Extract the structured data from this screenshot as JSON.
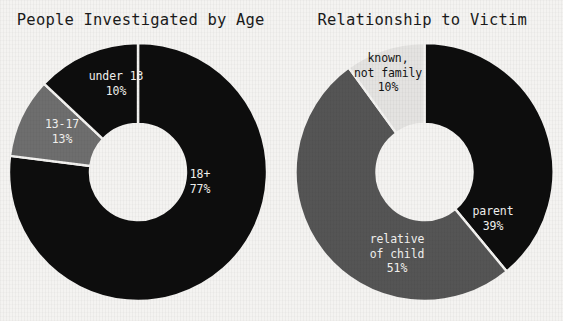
{
  "page": {
    "background_color": "#f4f3f1",
    "width": 563,
    "height": 321
  },
  "charts": [
    {
      "id": "people-investigated-by-age",
      "title": "People Investigated by Age",
      "center": {
        "x": 138,
        "y": 172
      },
      "outer_radius": 129,
      "inner_radius": 48,
      "slices": [
        {
          "label": "18+",
          "percent_label": "77%",
          "value": 77,
          "color": "#0d0d0d",
          "text_color": "#f2f1ef",
          "label_x": 200,
          "label_y": 178
        },
        {
          "label": "under 13",
          "percent_label": "10%",
          "value": 10,
          "color": "#6e6e6e",
          "text_color": "#f2f1ef",
          "label_x": 116,
          "label_y": 80
        },
        {
          "label": "13-17",
          "percent_label": "13%",
          "value": 13,
          "color": "#0d0d0d",
          "text_color": "#f2f1ef",
          "label_x": 62,
          "label_y": 128
        }
      ]
    },
    {
      "id": "relationship-to-victim",
      "title": "Relationship to Victim",
      "center": {
        "x": 142.5,
        "y": 172
      },
      "outer_radius": 129,
      "inner_radius": 48,
      "slices": [
        {
          "label": "parent",
          "percent_label": "39%",
          "value": 39,
          "color": "#0d0d0d",
          "text_color": "#f2f1ef",
          "label_x": 211,
          "label_y": 215
        },
        {
          "label": "relative of child",
          "percent_label": "51%",
          "value": 51,
          "color": "#555555",
          "text_color": "#f2f1ef",
          "label_x": 115,
          "label_y": 243
        },
        {
          "label": "known, not family",
          "percent_label": "10%",
          "value": 10,
          "color": "#e4e3e1",
          "text_color": "#151515",
          "label_x": 106,
          "label_y": 62
        }
      ]
    }
  ],
  "chart_data": [
    {
      "type": "pie",
      "title": "People Investigated by Age",
      "variant": "donut",
      "categories": [
        "18+",
        "under 13",
        "13-17"
      ],
      "values": [
        77,
        10,
        13
      ],
      "value_labels": [
        "77%",
        "10%",
        "13%"
      ],
      "unit": "percent",
      "colors": [
        "#0d0d0d",
        "#6e6e6e",
        "#0d0d0d"
      ],
      "start_angle_deg": 0,
      "direction": "clockwise",
      "legend": "none",
      "labels_inside_slices": true,
      "xlabel": "",
      "ylabel": ""
    },
    {
      "type": "pie",
      "title": "Relationship to Victim",
      "variant": "donut",
      "categories": [
        "parent",
        "relative of child",
        "known, not family"
      ],
      "values": [
        39,
        51,
        10
      ],
      "value_labels": [
        "39%",
        "51%",
        "10%"
      ],
      "unit": "percent",
      "colors": [
        "#0d0d0d",
        "#555555",
        "#e4e3e1"
      ],
      "start_angle_deg": 0,
      "direction": "clockwise",
      "legend": "none",
      "labels_inside_slices": true,
      "xlabel": "",
      "ylabel": ""
    }
  ]
}
